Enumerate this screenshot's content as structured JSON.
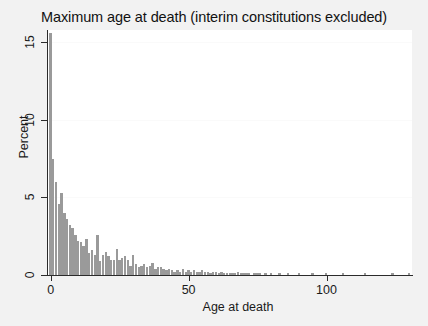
{
  "chart": {
    "title": "Maximum age at death (interim constitutions excluded)",
    "xlabel": "Age at death",
    "ylabel": "Percent",
    "x_ticks": [
      "0",
      "50",
      "100"
    ],
    "y_ticks": [
      "0",
      "5",
      "10",
      "15"
    ],
    "bar_color": "#9a9a9a",
    "plot_bg": "#ffffff",
    "figure_bg": "#f2f2f2"
  },
  "chart_data": {
    "type": "bar",
    "title": "Maximum age at death (interim constitutions excluded)",
    "subtitle": "",
    "xlabel": "Age at death",
    "ylabel": "Percent",
    "xlim": [
      -1,
      131
    ],
    "ylim": [
      0,
      15.8
    ],
    "xticks": [
      0,
      50,
      100
    ],
    "yticks": [
      0,
      5,
      10,
      15
    ],
    "grid": true,
    "legend": null,
    "bin_width": 1,
    "categories": [
      0,
      1,
      2,
      3,
      4,
      5,
      6,
      7,
      8,
      9,
      10,
      11,
      12,
      13,
      14,
      15,
      16,
      17,
      18,
      19,
      20,
      21,
      22,
      23,
      24,
      25,
      26,
      27,
      28,
      29,
      30,
      31,
      32,
      33,
      34,
      35,
      36,
      37,
      38,
      39,
      40,
      41,
      42,
      43,
      44,
      45,
      46,
      47,
      48,
      49,
      50,
      51,
      52,
      53,
      54,
      55,
      56,
      57,
      58,
      59,
      60,
      61,
      62,
      63,
      64,
      65,
      66,
      67,
      68,
      69,
      70,
      71,
      72,
      73,
      74,
      75,
      76,
      77,
      78,
      79,
      80,
      81,
      82,
      83,
      84,
      85,
      86,
      87,
      88,
      89,
      90,
      91,
      92,
      93,
      94,
      95,
      96,
      97,
      98,
      99,
      100,
      101,
      102,
      103,
      104,
      105,
      106,
      107,
      108,
      109,
      110,
      111,
      112,
      113,
      114,
      115,
      116,
      117,
      118,
      119,
      120,
      121,
      122,
      123,
      124,
      125,
      126,
      127,
      128,
      129,
      130
    ],
    "values": [
      15.6,
      7.5,
      6.0,
      4.6,
      5.3,
      4.0,
      3.6,
      3.2,
      3.0,
      2.6,
      2.2,
      2.1,
      1.9,
      2.3,
      1.4,
      1.6,
      1.3,
      2.6,
      0.9,
      1.3,
      1.5,
      1.2,
      1.0,
      1.0,
      1.7,
      1.0,
      1.1,
      1.2,
      1.0,
      0.6,
      1.3,
      0.7,
      0.5,
      0.6,
      0.7,
      0.5,
      0.6,
      0.8,
      0.4,
      0.5,
      0.5,
      0.4,
      0.3,
      0.4,
      0.3,
      0.2,
      0.3,
      0.2,
      0.4,
      0.2,
      0.3,
      0.2,
      0.3,
      0.2,
      0.2,
      0.3,
      0.2,
      0.2,
      0.1,
      0.2,
      0.2,
      0.1,
      0.2,
      0.1,
      0.1,
      0.1,
      0.1,
      0.1,
      0.2,
      0.1,
      0.1,
      0.1,
      0.1,
      0.0,
      0.1,
      0.1,
      0.1,
      0.0,
      0.1,
      0.0,
      0.1,
      0.0,
      0.0,
      0.1,
      0.0,
      0.0,
      0.1,
      0.0,
      0.0,
      0.0,
      0.1,
      0.0,
      0.0,
      0.0,
      0.0,
      0.1,
      0.0,
      0.0,
      0.0,
      0.0,
      0.1,
      0.0,
      0.0,
      0.0,
      0.0,
      0.0,
      0.1,
      0.0,
      0.0,
      0.0,
      0.0,
      0.0,
      0.0,
      0.0,
      0.1,
      0.0,
      0.0,
      0.0,
      0.0,
      0.0,
      0.0,
      0.0,
      0.0,
      0.0,
      0.1,
      0.0,
      0.0,
      0.0,
      0.0,
      0.0,
      0.1
    ]
  }
}
